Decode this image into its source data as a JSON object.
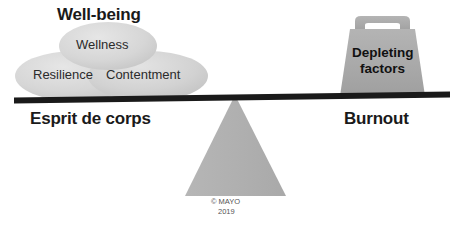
{
  "diagram": {
    "title": "Well-being",
    "left_side_label": "Esprit de corps",
    "right_side_label": "Burnout",
    "bubbles": [
      {
        "label": "Wellness",
        "name": "bubble-wellness"
      },
      {
        "label": "Resilience",
        "name": "bubble-resilience"
      },
      {
        "label": "Contentment",
        "name": "bubble-contentment"
      }
    ],
    "weight": {
      "line1": "Depleting",
      "line2": "factors"
    },
    "copyright": {
      "line1": "© MAYO",
      "line2": "2019"
    },
    "colors": {
      "bubble_fill": "#d4d4d4",
      "bubble_fill_light": "#dcdcdc",
      "weight_fill": "#a8a8a8",
      "fulcrum_fill": "#b0b0b0",
      "beam": "#1a1a1a",
      "text": "#1a1a1a",
      "background": "#ffffff"
    }
  }
}
